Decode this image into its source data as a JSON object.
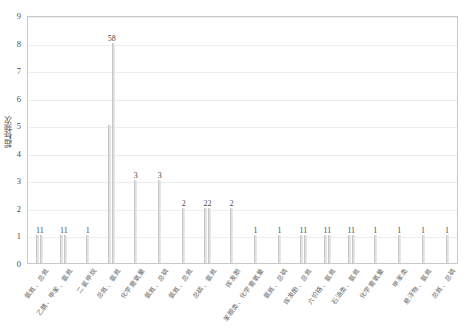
{
  "chart_data": {
    "type": "bar",
    "title": "",
    "subtitle": "",
    "xlabel": "",
    "ylabel": "超标频次",
    "ylim": [
      0,
      9
    ],
    "ytick_labels": [
      "0",
      "1",
      "2",
      "3",
      "4",
      "5",
      "6",
      "7",
      "8",
      "9"
    ],
    "grid": true,
    "legend": "none",
    "bar_color": "#d2d2d2",
    "axis_color": "#c9c9c9",
    "categories": [
      "氨氮、总氮",
      "乙腈、甲苯、氨氮",
      "二氯甲烷",
      "总氮、氨氮",
      "化学需氧量",
      "氨氮、总磷",
      "氨氮、总氮",
      "总磷、氨氮",
      "挥发酚",
      "苯胺类、化学需氧量",
      "氨氮、总磷",
      "挥发酚、总氮",
      "六价铬、氨氮",
      "石油类、氨氮",
      "化学需氧量",
      "甲苯类",
      "悬浮物、氨氮",
      "总氮、总磷"
    ],
    "groups": [
      {
        "label": "11",
        "values": [
          1,
          1
        ]
      },
      {
        "label": "11",
        "values": [
          1,
          1
        ]
      },
      {
        "label": "1",
        "values": [
          1
        ]
      },
      {
        "label": "58",
        "values": [
          5,
          8
        ]
      },
      {
        "label": "3",
        "values": [
          3
        ]
      },
      {
        "label": "3",
        "values": [
          3
        ]
      },
      {
        "label": "2",
        "values": [
          2
        ]
      },
      {
        "label": "22",
        "values": [
          2,
          2
        ]
      },
      {
        "label": "2",
        "values": [
          2
        ]
      },
      {
        "label": "1",
        "values": [
          1
        ]
      },
      {
        "label": "1",
        "values": [
          1
        ]
      },
      {
        "label": "11",
        "values": [
          1,
          1
        ]
      },
      {
        "label": "11",
        "values": [
          1,
          1
        ]
      },
      {
        "label": "11",
        "values": [
          1,
          1
        ]
      },
      {
        "label": "1",
        "values": [
          1
        ]
      },
      {
        "label": "1",
        "values": [
          1
        ]
      },
      {
        "label": "1",
        "values": [
          1
        ]
      },
      {
        "label": "1",
        "values": [
          1
        ]
      }
    ]
  }
}
